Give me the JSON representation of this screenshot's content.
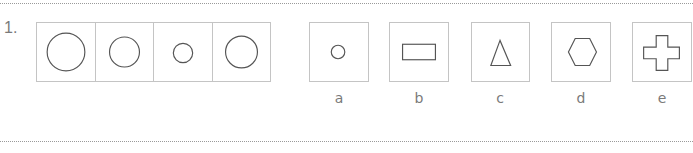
{
  "question": {
    "number": "1."
  },
  "sequence": {
    "items": [
      {
        "shape": "circle",
        "size": "large",
        "diameter_px": 39
      },
      {
        "shape": "circle",
        "size": "medium",
        "diameter_px": 31
      },
      {
        "shape": "circle",
        "size": "small",
        "diameter_px": 20
      },
      {
        "shape": "circle",
        "size": "medium-large",
        "diameter_px": 33
      }
    ]
  },
  "options": [
    {
      "label": "a",
      "shape": "circle"
    },
    {
      "label": "b",
      "shape": "rectangle"
    },
    {
      "label": "c",
      "shape": "triangle"
    },
    {
      "label": "d",
      "shape": "hexagon"
    },
    {
      "label": "e",
      "shape": "cross"
    }
  ],
  "colors": {
    "stroke": "#555555",
    "box_border": "#c4c4c4",
    "text": "#7a7a7a",
    "dotted_rule": "#9a9a9a"
  }
}
